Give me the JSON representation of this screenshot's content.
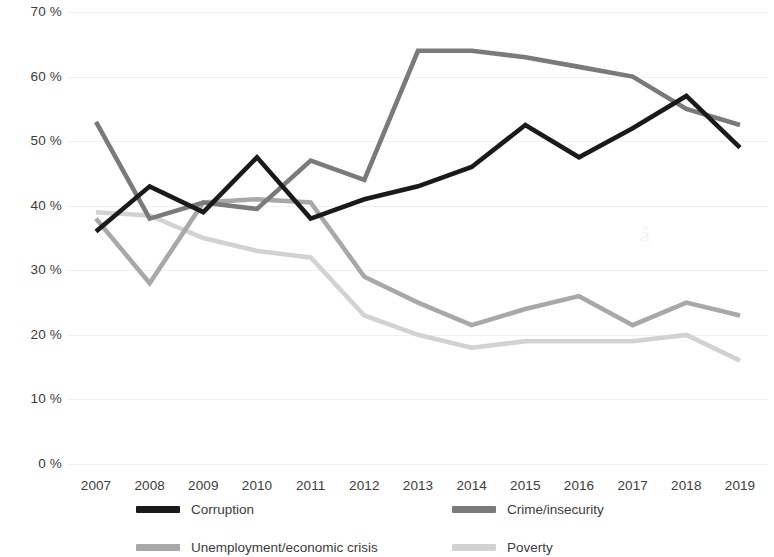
{
  "chart_data": {
    "type": "line",
    "title": "",
    "subtitle": "",
    "xlabel": "",
    "ylabel": "",
    "categories": [
      "2007",
      "2008",
      "2009",
      "2010",
      "2011",
      "2012",
      "2013",
      "2014",
      "2015",
      "2016",
      "2017",
      "2018",
      "2019"
    ],
    "x": [
      2007,
      2008,
      2009,
      2010,
      2011,
      2012,
      2013,
      2014,
      2015,
      2016,
      2017,
      2018,
      2019
    ],
    "ylim": [
      0,
      70
    ],
    "ytick_labels": [
      "0 %",
      "10 %",
      "20 %",
      "30 %",
      "40 %",
      "50 %",
      "60 %",
      "70 %"
    ],
    "ytick_values": [
      0,
      10,
      20,
      30,
      40,
      50,
      60,
      70
    ],
    "grid": true,
    "legend_position": "bottom",
    "series": [
      {
        "name": "Corruption",
        "color": "#1a1a1a",
        "values": [
          36,
          43,
          39,
          47.5,
          38,
          41,
          43,
          46,
          52.5,
          47.5,
          52,
          57,
          49
        ]
      },
      {
        "name": "Crime/insecurity",
        "color": "#7a7a7a",
        "values": [
          53,
          38,
          40.5,
          39.5,
          47,
          44,
          64,
          64,
          63,
          61.5,
          60,
          55,
          52.5
        ]
      },
      {
        "name": "Unemployment/economic crisis",
        "color": "#a8a8a8",
        "values": [
          38,
          28,
          40.5,
          41,
          40.5,
          29,
          25,
          21.5,
          24,
          26,
          21.5,
          25,
          23
        ]
      },
      {
        "name": "Poverty",
        "color": "#d2d2d2",
        "values": [
          39,
          38.5,
          35,
          33,
          32,
          23,
          20,
          18,
          19,
          19,
          19,
          20,
          16
        ]
      }
    ]
  },
  "legend": {
    "items": [
      {
        "label": "Corruption",
        "color": "#1a1a1a"
      },
      {
        "label": "Crime/insecurity",
        "color": "#7a7a7a"
      },
      {
        "label": "Unemployment/economic crisis",
        "color": "#a8a8a8"
      },
      {
        "label": "Poverty",
        "color": "#d2d2d2"
      }
    ]
  },
  "watermark": {
    "text": "å"
  }
}
